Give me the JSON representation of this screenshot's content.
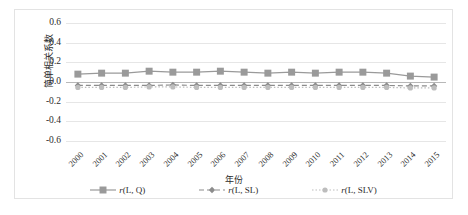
{
  "chart_data": {
    "type": "line",
    "title": "",
    "xlabel": "年份",
    "ylabel": "简单相关系数",
    "categories": [
      "2000",
      "2001",
      "2002",
      "2003",
      "2004",
      "2005",
      "2006",
      "2007",
      "2008",
      "2009",
      "2010",
      "2011",
      "2012",
      "2013",
      "2014",
      "2015"
    ],
    "ylim": [
      -0.6,
      0.6
    ],
    "yticks": [
      "0.6",
      "0.4",
      "0.2",
      "0.0",
      "-0.2",
      "-0.4",
      "-0.6"
    ],
    "ytick_values": [
      0.6,
      0.4,
      0.2,
      0.0,
      -0.2,
      -0.4,
      -0.6
    ],
    "grid": true,
    "legend_position": "bottom",
    "series": [
      {
        "name": "r(L, Q)",
        "label_main": "r",
        "label_args": "(L, Q)",
        "marker": "square",
        "linestyle": "solid",
        "color": "#9a9a9a",
        "values": [
          0.08,
          0.09,
          0.09,
          0.11,
          0.1,
          0.1,
          0.11,
          0.1,
          0.09,
          0.1,
          0.09,
          0.1,
          0.1,
          0.09,
          0.06,
          0.05
        ]
      },
      {
        "name": "r(L, SL)",
        "label_main": "r",
        "label_args": "(L, SL)",
        "marker": "diamond",
        "linestyle": "dashed",
        "color": "#8c8c8c",
        "values": [
          -0.035,
          -0.035,
          -0.035,
          -0.035,
          -0.03,
          -0.035,
          -0.035,
          -0.035,
          -0.035,
          -0.035,
          -0.035,
          -0.035,
          -0.035,
          -0.035,
          -0.04,
          -0.04
        ]
      },
      {
        "name": "r(L, SLV)",
        "label_main": "r",
        "label_args": "(L, SLV)",
        "marker": "circle",
        "linestyle": "dotted",
        "color": "#bdbdbd",
        "values": [
          -0.055,
          -0.055,
          -0.055,
          -0.05,
          -0.05,
          -0.055,
          -0.055,
          -0.055,
          -0.055,
          -0.055,
          -0.055,
          -0.055,
          -0.055,
          -0.055,
          -0.06,
          -0.06
        ]
      }
    ]
  }
}
